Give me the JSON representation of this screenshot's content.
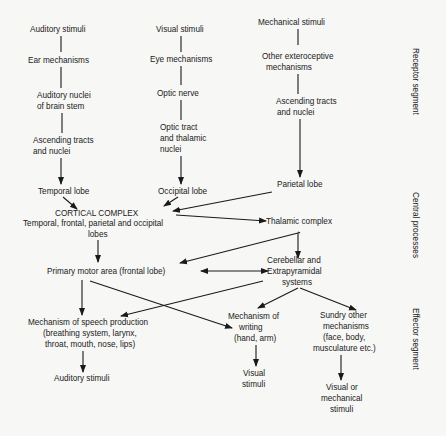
{
  "diagram": {
    "receptor": {
      "auditory": [
        "Auditory stimuli",
        "Ear mechanisms",
        "Auditory nuclei",
        "of brain stem",
        "Ascending tracts",
        "and nuclei",
        "Temporal lobe"
      ],
      "visual": [
        "Visual stimuli",
        "Eye mechanisms",
        "Optic nerve",
        "Optic tract",
        "and thalamic",
        "nuclei",
        "Occipital lobe"
      ],
      "mechanical": [
        "Mechanical stimuli",
        "Other exteroceptive",
        "mechanisms",
        "Ascending tracts",
        "and nuclei",
        "Parietal lobe"
      ]
    },
    "central": {
      "cortical_title": "CORTICAL COMPLEX",
      "cortical_sub1": "Temporal, frontal, parietal and occipital",
      "cortical_sub2": "lobes",
      "thalamic": "Thalamic complex",
      "primary_motor": "Primary motor area (frontal lobe)",
      "cerebellar": [
        "Cerebellar and",
        "Extrapyramidal",
        "systems"
      ]
    },
    "effector": {
      "speech": [
        "Mechanism of speech production",
        "(breathing system, larynx,",
        "throat, mouth, nose, lips)"
      ],
      "speech_out": "Auditory stimuli",
      "writing": [
        "Mechanism of",
        "writing",
        "(hand, arm)"
      ],
      "writing_out": [
        "Visual",
        "stimuli"
      ],
      "sundry": [
        "Sundry other",
        "mechanisms",
        "(face, body,",
        "musculature etc.)"
      ],
      "sundry_out": [
        "Visual or",
        "mechanical",
        "stimuli"
      ]
    },
    "segments": {
      "receptor": "Receptor segment",
      "central": "Central processes",
      "effector": "Effector segment"
    }
  }
}
